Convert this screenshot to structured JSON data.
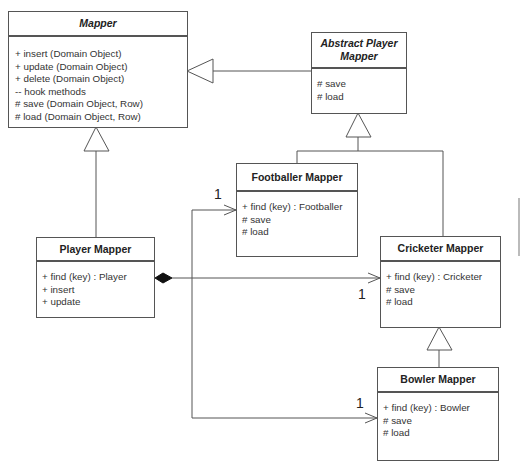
{
  "diagram": {
    "type": "uml-class-diagram",
    "classes": [
      {
        "id": "mapper",
        "name": "Mapper",
        "abstract": true,
        "operations": [
          "+ insert (Domain Object)",
          "+ update (Domain Object)",
          "+ delete (Domain Object)",
          "-- hook methods",
          "# save (Domain Object, Row)",
          "# load (Domain Object, Row)"
        ]
      },
      {
        "id": "abstract_player_mapper",
        "name_line1": "Abstract Player",
        "name_line2": "Mapper",
        "abstract": true,
        "operations": [
          "# save",
          "# load"
        ]
      },
      {
        "id": "footballer_mapper",
        "name": "Footballer Mapper",
        "operations": [
          "+ find (key) : Footballer",
          "# save",
          "# load"
        ]
      },
      {
        "id": "player_mapper",
        "name": "Player Mapper",
        "operations": [
          "+ find (key) : Player",
          "+ insert",
          "+ update"
        ]
      },
      {
        "id": "cricketer_mapper",
        "name": "Cricketer Mapper",
        "operations": [
          "+ find (key) : Cricketer",
          "# save",
          "# load"
        ]
      },
      {
        "id": "bowler_mapper",
        "name": "Bowler Mapper",
        "operations": [
          "+ find (key) : Bowler",
          "# save",
          "# load"
        ]
      }
    ],
    "relationships": [
      {
        "type": "generalization",
        "from": "Abstract Player Mapper",
        "to": "Mapper"
      },
      {
        "type": "generalization",
        "from": "Player Mapper",
        "to": "Mapper"
      },
      {
        "type": "generalization",
        "from": "Footballer Mapper",
        "to": "Abstract Player Mapper"
      },
      {
        "type": "generalization",
        "from": "Cricketer Mapper",
        "to": "Abstract Player Mapper"
      },
      {
        "type": "generalization",
        "from": "Bowler Mapper",
        "to": "Cricketer Mapper"
      },
      {
        "type": "composition",
        "from": "Player Mapper",
        "to": "Footballer Mapper",
        "multiplicity": "1"
      },
      {
        "type": "composition",
        "from": "Player Mapper",
        "to": "Cricketer Mapper",
        "multiplicity": "1"
      },
      {
        "type": "composition",
        "from": "Player Mapper",
        "to": "Bowler Mapper",
        "multiplicity": "1"
      }
    ],
    "multiplicities": {
      "footballer": "1",
      "cricketer": "1",
      "bowler": "1"
    },
    "colors": {
      "line": "#555555",
      "text": "#222222",
      "background": "#ffffff"
    }
  }
}
